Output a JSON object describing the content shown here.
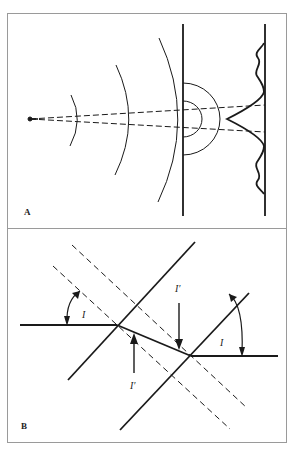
{
  "figure": {
    "panels": [
      {
        "id": "A",
        "label": "A",
        "description": "Point source emitting circular wavefronts toward a barrier with two slits; diffracted semicircular waves behind slits; interference intensity pattern on screen"
      },
      {
        "id": "B",
        "label": "B",
        "description": "Refraction of a ray through a slab between two parallel interfaces with dashed normals; incidence angle I and refraction angle I'",
        "angle_labels": {
          "incidence_left": "I",
          "incidence_right": "I",
          "refraction_top": "I′",
          "refraction_bottom": "I′"
        }
      }
    ],
    "colors": {
      "line": "#1a1a1a",
      "frame": "#9a9a9a",
      "background": "#ffffff"
    }
  }
}
